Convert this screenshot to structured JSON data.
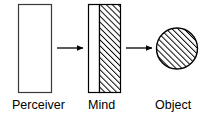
{
  "diagram": {
    "type": "concept-diagram",
    "background_color": "#ffffff",
    "stroke_color": "#000000",
    "fill_white": "#ffffff",
    "hatch_color": "#000000",
    "nodes": [
      {
        "id": "perceiver",
        "label": "Perceiver",
        "shape": "rectangle",
        "fill": "none",
        "hatched": false,
        "x": 18,
        "y": 4,
        "width": 34,
        "height": 89
      },
      {
        "id": "mind",
        "label": "Mind",
        "shape": "rectangle",
        "fill": "split",
        "hatched": true,
        "hatch_fraction": 0.66,
        "x": 88,
        "y": 4,
        "width": 33,
        "height": 89
      },
      {
        "id": "object",
        "label": "Object",
        "shape": "circle",
        "fill": "none",
        "hatched": true,
        "cx": 177,
        "cy": 48,
        "r": 21
      }
    ],
    "arrows": [
      {
        "id": "arrow-perceiver-to-mind",
        "from": "perceiver",
        "to": "mind",
        "x1": 57,
        "x2": 84,
        "y": 48,
        "direction": "right"
      },
      {
        "id": "arrow-mind-to-object",
        "from": "mind",
        "to": "object",
        "x1": 125,
        "x2": 153,
        "y": 48,
        "direction": "right"
      }
    ],
    "labels": {
      "perceiver": "Perceiver",
      "mind": "Mind",
      "object": "Object"
    }
  }
}
